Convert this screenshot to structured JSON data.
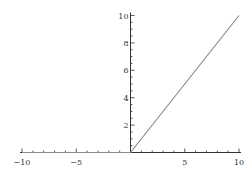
{
  "chart_data": {
    "type": "line",
    "title": "",
    "xlabel": "",
    "ylabel": "",
    "xlim": [
      -10,
      10
    ],
    "ylim": [
      0,
      10
    ],
    "grid": false,
    "legend": null,
    "x_ticks": [
      -10,
      -5,
      5,
      10
    ],
    "x_tick_labels": [
      "−10",
      "−5",
      "5",
      "10"
    ],
    "y_ticks": [
      2,
      4,
      6,
      8,
      10
    ],
    "y_tick_labels": [
      "2",
      "4",
      "6",
      "8",
      "10"
    ],
    "series": [
      {
        "name": "f(x)",
        "x": [
          -10,
          0,
          10
        ],
        "y": [
          0,
          0,
          10
        ],
        "note": "line visible only for x >= 0 (y = x); for x < 0 it lies on the axis",
        "color": "#8c8c8c"
      }
    ]
  },
  "colors": {
    "axis": "#333333",
    "line": "#8c8c8c",
    "background": "#ffffff"
  }
}
